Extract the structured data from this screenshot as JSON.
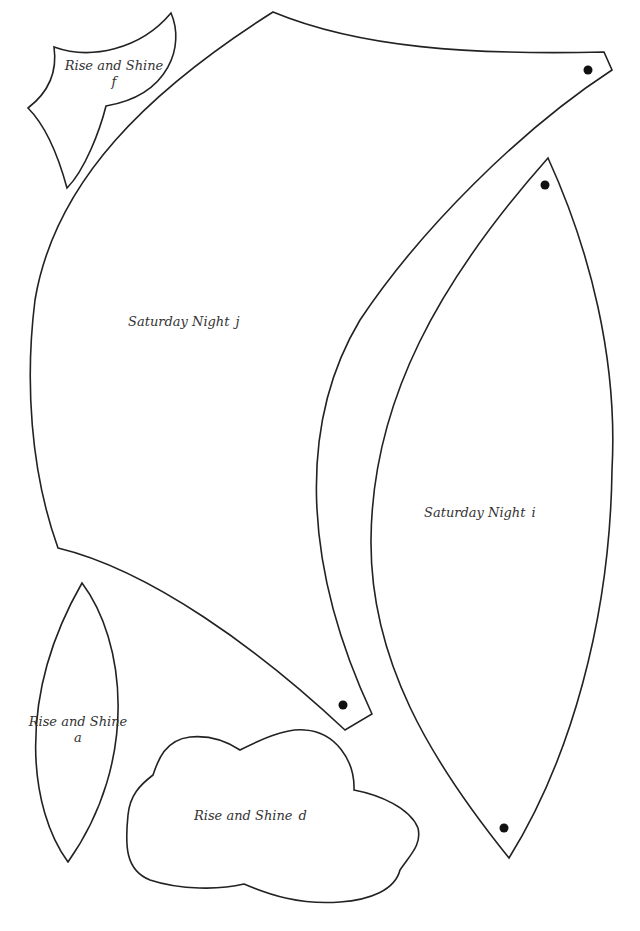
{
  "page": {
    "background": "#ffffff",
    "stroke_color": "#222222",
    "dot_color": "#111111"
  },
  "pieces": [
    {
      "id": "f",
      "name": "Rise and Shine",
      "letter": "f",
      "markers": 0
    },
    {
      "id": "j",
      "name": "Saturday Night",
      "letter": "j",
      "markers": 2
    },
    {
      "id": "i",
      "name": "Saturday Night",
      "letter": "i",
      "markers": 2
    },
    {
      "id": "a",
      "name": "Rise and Shine",
      "letter": "a",
      "markers": 0
    },
    {
      "id": "d",
      "name": "Rise and Shine",
      "letter": "d",
      "markers": 0
    }
  ]
}
